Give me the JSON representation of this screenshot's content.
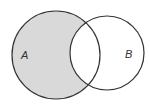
{
  "diagram": {
    "type": "venn",
    "shaded_region": "A only (A minus B)",
    "sets": [
      {
        "label": "A",
        "cx": 56,
        "cy": 55,
        "r": 44
      },
      {
        "label": "B",
        "cx": 107,
        "cy": 53,
        "r": 37
      }
    ],
    "colors": {
      "shade": "#d9d9d9",
      "stroke": "#333333",
      "background": "#ffffff"
    }
  }
}
